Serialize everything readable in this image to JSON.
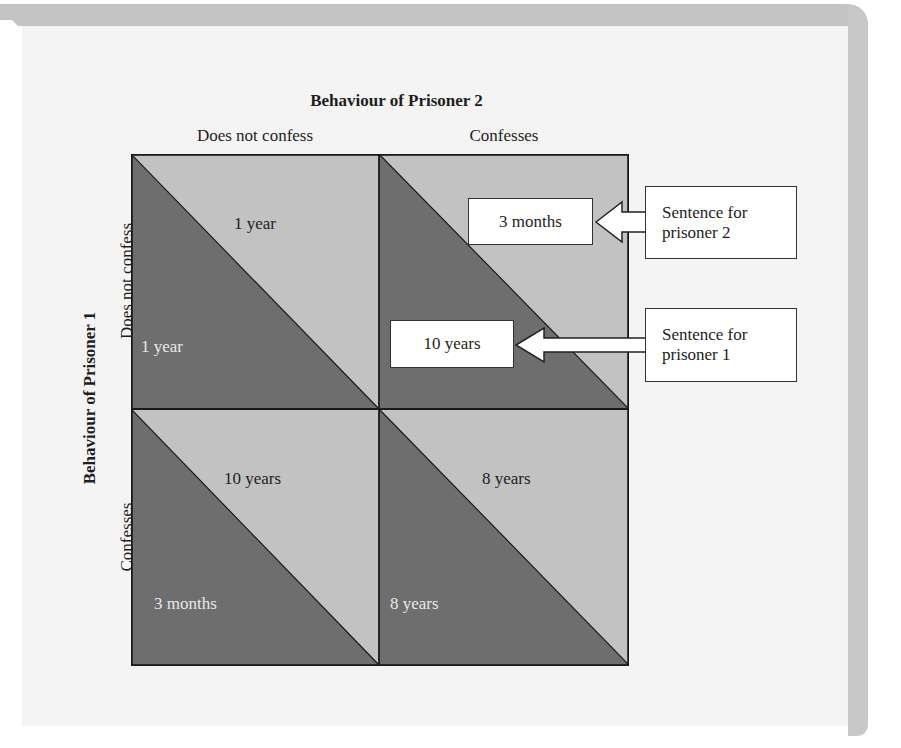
{
  "diagram": {
    "column_axis_title": "Behaviour of Prisoner 2",
    "row_axis_title": "Behaviour of Prisoner 1",
    "columns": [
      "Does not confess",
      "Confesses"
    ],
    "rows": [
      "Does not confess",
      "Confesses"
    ],
    "cells": [
      {
        "row": "Does not confess",
        "col": "Does not confess",
        "prisoner1": "1 year",
        "prisoner2": "1 year"
      },
      {
        "row": "Does not confess",
        "col": "Confesses",
        "prisoner1": "10 years",
        "prisoner2": "3 months"
      },
      {
        "row": "Confesses",
        "col": "Does not confess",
        "prisoner1": "3 months",
        "prisoner2": "10 years"
      },
      {
        "row": "Confesses",
        "col": "Confesses",
        "prisoner1": "8 years",
        "prisoner2": "8 years"
      }
    ],
    "callouts": {
      "prisoner2_line1": "Sentence for",
      "prisoner2_line2": "prisoner 2",
      "prisoner1_line1": "Sentence for",
      "prisoner1_line2": "prisoner 1"
    },
    "legend_meaning": {
      "light_triangle": "Sentence for prisoner 2 (upper-right)",
      "dark_triangle": "Sentence for prisoner 1 (lower-left)"
    },
    "colors": {
      "light_triangle": "#c2c2c2",
      "dark_triangle": "#6e6e6e",
      "page_background": "#f4f4f4",
      "frame": "#c4c4c4"
    }
  }
}
